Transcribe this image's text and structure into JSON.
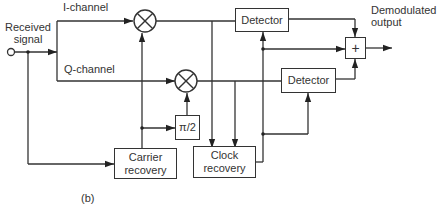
{
  "diagram": {
    "type": "block-diagram",
    "caption": "(b)",
    "labels": {
      "input": "Received signal",
      "input_line1": "Received",
      "input_line2": "signal",
      "i_channel": "I-channel",
      "q_channel": "Q-channel",
      "output_line1": "Demodulated",
      "output_line2": "output"
    },
    "blocks": {
      "mixer_i": "⊗",
      "mixer_q": "⊗",
      "detector_i": "Detector",
      "detector_q": "Detector",
      "phase_shift": "π/2",
      "carrier_recovery_line1": "Carrier",
      "carrier_recovery_line2": "recovery",
      "clock_recovery_line1": "Clock",
      "clock_recovery_line2": "recovery",
      "adder": "+"
    },
    "connections": [
      {
        "from": "Received signal",
        "to": "I-channel mixer"
      },
      {
        "from": "Received signal",
        "to": "Q-channel mixer"
      },
      {
        "from": "Received signal",
        "to": "Carrier recovery"
      },
      {
        "from": "Carrier recovery",
        "to": "I-channel mixer"
      },
      {
        "from": "Carrier recovery",
        "to": "π/2"
      },
      {
        "from": "π/2",
        "to": "Q-channel mixer"
      },
      {
        "from": "I-channel mixer",
        "to": "Detector (I)"
      },
      {
        "from": "Q-channel mixer",
        "to": "Detector (Q)"
      },
      {
        "from": "I-channel mixer",
        "to": "Clock recovery"
      },
      {
        "from": "Q-channel mixer",
        "to": "Clock recovery"
      },
      {
        "from": "Clock recovery",
        "to": "Detector (I)"
      },
      {
        "from": "Clock recovery",
        "to": "Detector (Q)"
      },
      {
        "from": "Clock recovery",
        "to": "Adder"
      },
      {
        "from": "Detector (I)",
        "to": "Adder"
      },
      {
        "from": "Detector (Q)",
        "to": "Adder"
      },
      {
        "from": "Adder",
        "to": "Demodulated output"
      }
    ]
  }
}
